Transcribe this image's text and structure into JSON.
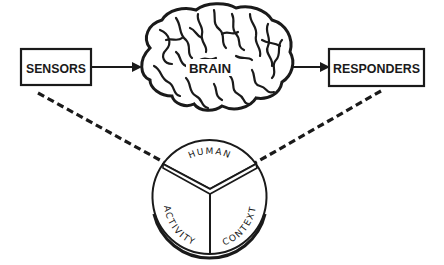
{
  "diagram": {
    "nodes": {
      "sensors": {
        "label": "SENSORS"
      },
      "brain": {
        "label": "BRAIN"
      },
      "responders": {
        "label": "RESPONDERS"
      }
    },
    "edges": [
      {
        "from": "sensors",
        "to": "brain",
        "style": "solid-arrow"
      },
      {
        "from": "brain",
        "to": "responders",
        "style": "solid-arrow"
      },
      {
        "from": "sensors",
        "to": "model",
        "style": "dashed"
      },
      {
        "from": "responders",
        "to": "model",
        "style": "dashed"
      }
    ],
    "model": {
      "segments": [
        {
          "label": "HUMAN"
        },
        {
          "label": "ACTIVITY"
        },
        {
          "label": "CONTEXT"
        }
      ]
    },
    "colors": {
      "ink": "#1a1a1a",
      "background": "#ffffff"
    }
  }
}
